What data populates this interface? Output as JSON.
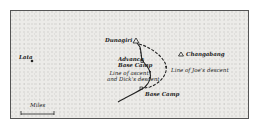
{
  "map": {
    "places": {
      "dunagiri": "Dunagiri",
      "changabang": "Changabang",
      "lata": "Lata",
      "advance_base_camp_line1": "Advance",
      "advance_base_camp_line2": "Base Camp",
      "base_camp": "Base Camp"
    },
    "routes": {
      "ascent_line1": "Line of ascent",
      "ascent_line2": "and Dick's descent",
      "joes_descent": "Line of Joe's descent"
    },
    "scale": {
      "label": "Miles",
      "start": "0",
      "end": "1"
    },
    "symbols": {
      "peak": "triangle",
      "village": "dot",
      "camp": "square"
    },
    "colors": {
      "background": "#ecebe8",
      "ink": "#222222",
      "border": "#555555"
    }
  }
}
